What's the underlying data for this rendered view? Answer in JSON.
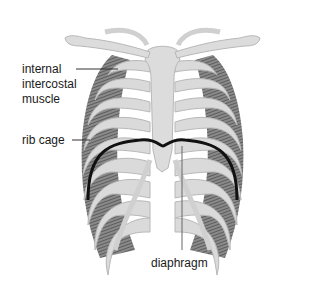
{
  "diagram": {
    "labels": {
      "internal_intercostal_line1": "internal",
      "internal_intercostal_line2": "intercostal",
      "internal_intercostal_line3": "muscle",
      "rib_cage": "rib cage",
      "diaphragm": "diaphragm"
    },
    "colors": {
      "bone": "#d9d9d9",
      "bone_outline": "#bdbdbd",
      "muscle": "#6b6b6b",
      "diaphragm": "#111111",
      "leader_line": "#333333"
    }
  }
}
